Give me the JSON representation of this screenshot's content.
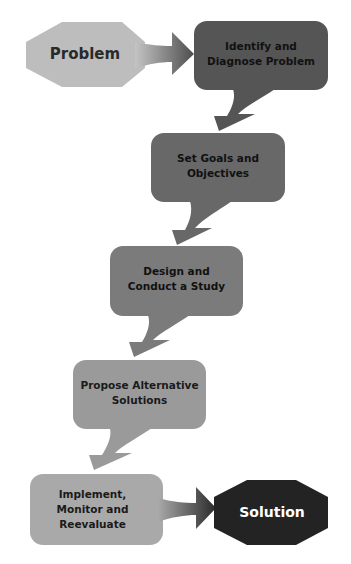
{
  "diagram": {
    "type": "flowchart",
    "start": {
      "label": "Problem",
      "color": "#bdbdbd",
      "text_color": "#2a2a2a"
    },
    "end": {
      "label": "Solution",
      "color": "#232323",
      "text_color": "#ffffff"
    },
    "steps": [
      {
        "label": "Identify and Diagnose Problem",
        "color": "#555555"
      },
      {
        "label": "Set Goals and Objectives",
        "color": "#686868"
      },
      {
        "label": "Design and Conduct a Study",
        "color": "#7b7b7b"
      },
      {
        "label": "Propose Alternative Solutions",
        "color": "#9a9a9a"
      },
      {
        "label": "Implement, Monitor and Reevaluate",
        "color": "#a9a9a9"
      }
    ]
  }
}
